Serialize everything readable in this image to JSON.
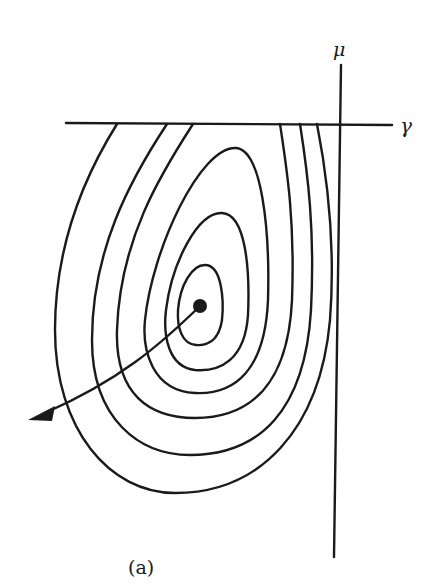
{
  "figure": {
    "caption": "(a)",
    "axes": {
      "vertical_label": "μ",
      "horizontal_label": "γ"
    },
    "contours": {
      "closed_count": 3,
      "open_count": 3,
      "center_point": "filled-dot"
    },
    "trajectory": {
      "description": "arrow from center dot curving down-left out of contours"
    },
    "colors": {
      "stroke": "#1a1a1a",
      "background": "#ffffff"
    }
  }
}
